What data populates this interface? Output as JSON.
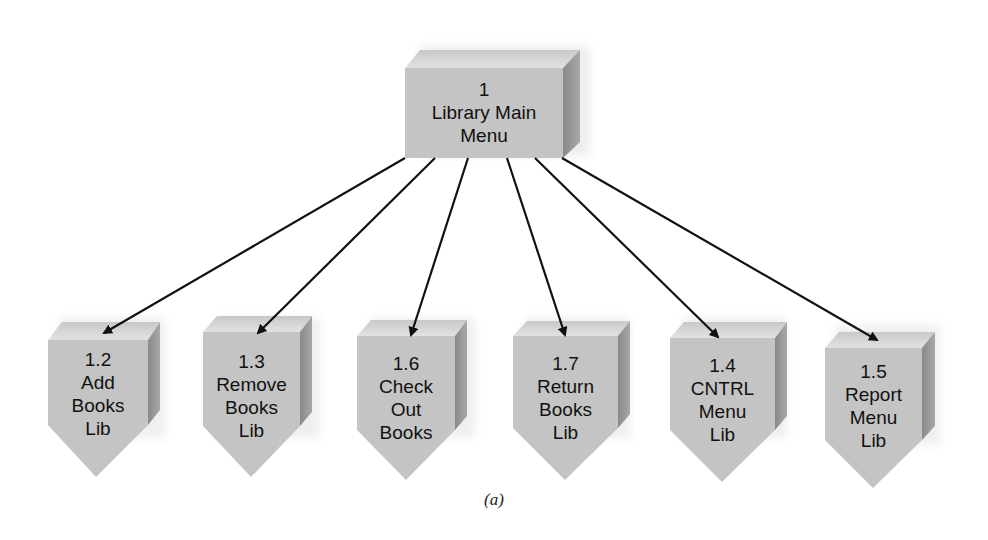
{
  "diagram": {
    "type": "hierarchy-chart",
    "colors": {
      "front_face": "#c4c4c4",
      "top_face": "#dcdcdc",
      "side_face": "#8f8f8f",
      "arrow": "#111111",
      "text": "#111111"
    },
    "root": {
      "id": "1",
      "lines": [
        "1",
        "Library Main",
        "Menu"
      ]
    },
    "children": [
      {
        "id": "1.2",
        "lines": [
          "1.2",
          "Add",
          "Books",
          "Lib"
        ]
      },
      {
        "id": "1.3",
        "lines": [
          "1.3",
          "Remove",
          "Books",
          "Lib"
        ]
      },
      {
        "id": "1.6",
        "lines": [
          "1.6",
          "Check",
          "Out",
          "Books"
        ]
      },
      {
        "id": "1.7",
        "lines": [
          "1.7",
          "Return",
          "Books",
          "Lib"
        ]
      },
      {
        "id": "1.4",
        "lines": [
          "1.4",
          "CNTRL",
          "Menu",
          "Lib"
        ]
      },
      {
        "id": "1.5",
        "lines": [
          "1.5",
          "Report",
          "Menu",
          "Lib"
        ]
      }
    ],
    "edges": [
      {
        "from": "1",
        "to": "1.2"
      },
      {
        "from": "1",
        "to": "1.3"
      },
      {
        "from": "1",
        "to": "1.6"
      },
      {
        "from": "1",
        "to": "1.7"
      },
      {
        "from": "1",
        "to": "1.4"
      },
      {
        "from": "1",
        "to": "1.5"
      }
    ],
    "caption": "(a)"
  }
}
